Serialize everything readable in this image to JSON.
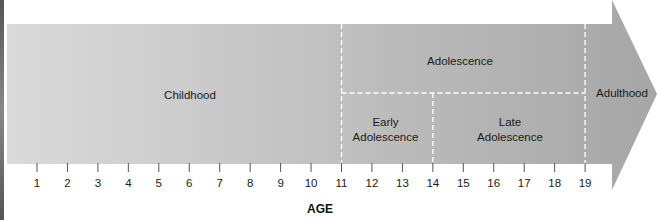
{
  "diagram": {
    "title": "",
    "axis_label": "AGE",
    "ages": [
      1,
      2,
      3,
      4,
      5,
      6,
      7,
      8,
      9,
      10,
      11,
      12,
      13,
      14,
      15,
      16,
      17,
      18,
      19
    ],
    "stages": [
      {
        "id": "childhood",
        "label": "Childhood",
        "start_age": 1,
        "end_age": 11,
        "level": "full"
      },
      {
        "id": "adolescence",
        "label": "Adolescence",
        "start_age": 11,
        "end_age": 19,
        "level": "top"
      },
      {
        "id": "early-adolescence",
        "label_line1": "Early",
        "label_line2": "Adolescence",
        "start_age": 11,
        "end_age": 14,
        "level": "bottom"
      },
      {
        "id": "late-adolescence",
        "label_line1": "Late",
        "label_line2": "Adolescence",
        "start_age": 14,
        "end_age": 19,
        "level": "bottom"
      },
      {
        "id": "adulthood",
        "label": "Adulthood",
        "start_age": 19,
        "end_age": null,
        "level": "full"
      }
    ],
    "boundary_ages": [
      11,
      14,
      19
    ],
    "colors": {
      "arrow_light": "#dadada",
      "arrow_dark": "#a6a6a6",
      "divider": "#ffffff",
      "text": "#1a1a1a"
    }
  },
  "labels": {
    "childhood": "Childhood",
    "adolescence": "Adolescence",
    "early_line1": "Early",
    "early_line2": "Adolescence",
    "late_line1": "Late",
    "late_line2": "Adolescence",
    "adulthood": "Adulthood",
    "axis": "AGE"
  }
}
